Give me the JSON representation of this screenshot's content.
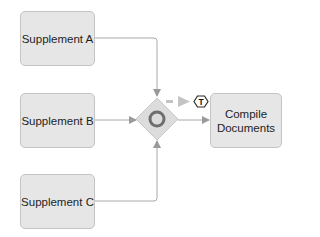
{
  "diagram": {
    "tasks": [
      {
        "id": "supplement-a",
        "label": "Supplement A"
      },
      {
        "id": "supplement-b",
        "label": "Supplement B"
      },
      {
        "id": "supplement-c",
        "label": "Supplement C"
      },
      {
        "id": "compile-documents",
        "label": "Compile Documents"
      }
    ],
    "gateway": {
      "type": "inclusive-gateway",
      "icon": "circle-icon"
    },
    "timer_marker": {
      "label": "T"
    },
    "colors": {
      "task_fill": "#e6e6e6",
      "task_border": "#c4c4c4",
      "connector": "#9a9a9a",
      "gateway_fill": "#d9d9d9",
      "gateway_ring": "#6e6e6e",
      "dashed_arrow": "#bdbdbd"
    }
  }
}
